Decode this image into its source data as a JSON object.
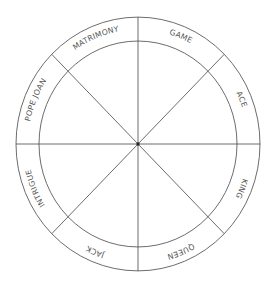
{
  "diagram": {
    "type": "wheel",
    "center": {
      "x": 138,
      "y": 144
    },
    "outer_radius": {
      "x": 122,
      "y": 127
    },
    "inner_radius": {
      "x": 99,
      "y": 103
    },
    "sector_count": 8,
    "line_color": "#4a4a4a",
    "text_color": "#555555",
    "sectors": [
      {
        "label": "MATRIMONY",
        "position": "top-left"
      },
      {
        "label": "GAME",
        "position": "top-right"
      },
      {
        "label": "ACE",
        "position": "right-upper"
      },
      {
        "label": "KING",
        "position": "right-lower"
      },
      {
        "label": "QUEEN",
        "position": "bottom-right"
      },
      {
        "label": "JACK",
        "position": "bottom-left"
      },
      {
        "label": "INTRIGUE",
        "position": "left-lower"
      },
      {
        "label": "POPE JOAN",
        "position": "left-upper"
      }
    ]
  }
}
